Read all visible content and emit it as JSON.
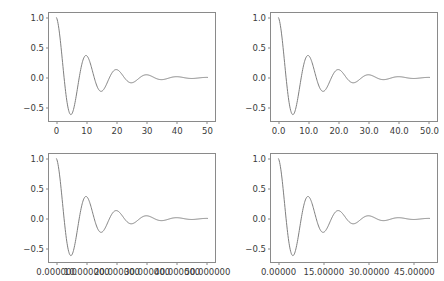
{
  "figure": {
    "background_color": "#ffffff",
    "line_color": "#7f7f7f",
    "axes_color": "#8a8a8a",
    "tick_label_color": "#3a3a3a",
    "rows": 2,
    "cols": 2
  },
  "chart_data": [
    {
      "type": "line",
      "name": "top-left",
      "title": "",
      "xlabel": "",
      "ylabel": "",
      "xlim": [
        -2.5,
        52.5
      ],
      "ylim": [
        -0.72,
        1.08
      ],
      "grid": false,
      "legend": null,
      "xticks": [
        0,
        10,
        20,
        30,
        40,
        50
      ],
      "xticklabels": [
        "0",
        "10",
        "20",
        "30",
        "40",
        "50"
      ],
      "yticks": [
        -0.5,
        0.0,
        0.5,
        1.0
      ],
      "yticklabels": [
        "−0.5",
        "0.0",
        "0.5",
        "1.0"
      ],
      "series": [
        {
          "name": "damped cosine",
          "expression": "exp(-0.1*x)*cos(0.628*x)",
          "x": [
            0,
            1,
            2,
            3,
            4,
            5,
            6,
            7,
            8,
            9,
            10,
            11,
            12,
            13,
            14,
            15,
            16,
            17,
            18,
            19,
            20,
            21,
            22,
            23,
            24,
            25,
            26,
            27,
            28,
            29,
            30,
            31,
            32,
            33,
            34,
            35,
            36,
            37,
            38,
            39,
            40,
            41,
            42,
            43,
            44,
            45,
            46,
            47,
            48,
            49,
            50
          ],
          "y": [
            1.0,
            0.733,
            0.28,
            -0.197,
            -0.543,
            -0.607,
            -0.45,
            -0.17,
            0.127,
            0.33,
            0.368,
            0.272,
            0.103,
            -0.072,
            -0.197,
            -0.221,
            -0.164,
            -0.062,
            0.046,
            0.12,
            0.135,
            0.099,
            0.037,
            -0.026,
            -0.072,
            -0.081,
            -0.06,
            -0.023,
            0.017,
            0.044,
            0.049,
            0.036,
            0.014,
            -0.01,
            -0.026,
            -0.029,
            -0.022,
            -0.008,
            0.006,
            0.016,
            0.018,
            0.013,
            0.005,
            -0.003,
            -0.01,
            -0.011,
            -0.008,
            -0.003,
            0.002,
            0.006,
            0.007
          ]
        }
      ]
    },
    {
      "type": "line",
      "name": "top-right",
      "title": "",
      "xlabel": "",
      "ylabel": "",
      "xlim": [
        -2.5,
        52.5
      ],
      "ylim": [
        -0.72,
        1.08
      ],
      "grid": false,
      "legend": null,
      "xticks": [
        0,
        10,
        20,
        30,
        40,
        50
      ],
      "xticklabels": [
        "0.0",
        "10.0",
        "20.0",
        "30.0",
        "40.0",
        "50.0"
      ],
      "yticks": [
        -0.5,
        0.0,
        0.5,
        1.0
      ],
      "yticklabels": [
        "−0.5",
        "0.0",
        "0.5",
        "1.0"
      ],
      "series": [
        {
          "name": "damped cosine",
          "expression": "exp(-0.1*x)*cos(0.628*x)"
        }
      ]
    },
    {
      "type": "line",
      "name": "bottom-left",
      "title": "",
      "xlabel": "",
      "ylabel": "",
      "xlim": [
        -2.5,
        52.5
      ],
      "ylim": [
        -0.72,
        1.08
      ],
      "grid": false,
      "legend": null,
      "xticks": [
        0,
        10,
        20,
        30,
        40,
        50
      ],
      "xticklabels": [
        "0.000000",
        "10.000000",
        "20.000000",
        "30.000000",
        "40.000000",
        "50.000000"
      ],
      "yticks": [
        -0.5,
        0.0,
        0.5,
        1.0
      ],
      "yticklabels": [
        "−0.5",
        "0.0",
        "0.5",
        "1.0"
      ],
      "series": [
        {
          "name": "damped cosine",
          "expression": "exp(-0.1*x)*cos(0.628*x)"
        }
      ]
    },
    {
      "type": "line",
      "name": "bottom-right",
      "title": "",
      "xlabel": "",
      "ylabel": "",
      "xlim": [
        -2.5,
        52.5
      ],
      "ylim": [
        -0.72,
        1.08
      ],
      "grid": false,
      "legend": null,
      "xticks": [
        0,
        15,
        30,
        45
      ],
      "xticklabels": [
        "0.00000",
        "15.00000",
        "30.00000",
        "45.00000"
      ],
      "yticks": [
        -0.5,
        0.0,
        0.5,
        1.0
      ],
      "yticklabels": [
        "−0.5",
        "0.0",
        "0.5",
        "1.0"
      ],
      "series": [
        {
          "name": "damped cosine",
          "expression": "exp(-0.1*x)*cos(0.628*x)"
        }
      ]
    }
  ]
}
